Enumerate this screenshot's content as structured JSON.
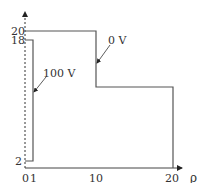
{
  "diagram": {
    "axis": {
      "x_label": "ρ",
      "x_ticks": [
        {
          "label": "0",
          "x": 22
        },
        {
          "label": "1",
          "x": 32
        },
        {
          "label": "10",
          "x": 96
        },
        {
          "label": "20",
          "x": 172
        }
      ],
      "y_ticks": [
        {
          "label": "20",
          "y": 31
        },
        {
          "label": "18",
          "y": 40
        },
        {
          "label": "2",
          "y": 162
        }
      ]
    },
    "labels": {
      "inner_voltage": "100 V",
      "outer_voltage": "0 V"
    },
    "colors": {
      "line": "#555555"
    }
  }
}
